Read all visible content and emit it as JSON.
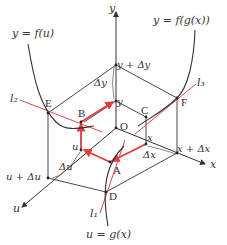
{
  "colors": {
    "axis": "#333333",
    "curve": "#333333",
    "tangent": "#e0474c",
    "path": "#e8393f",
    "background": "#ffffff"
  },
  "axes": {
    "y_label": "y",
    "x_label": "x",
    "u_label": "u"
  },
  "curves": {
    "f_u": "y = f(u)",
    "f_g_x": "y = f(g(x))",
    "g_x": "u = g(x)"
  },
  "tangents": {
    "l1": "l₁",
    "l2": "l₂",
    "l3": "l₃"
  },
  "points": {
    "O": "O",
    "A": "A",
    "B": "B",
    "C": "C",
    "D": "D",
    "E": "E",
    "F": "F"
  },
  "ticks": {
    "y": "y",
    "y_plus_dy": "y + Δy",
    "dy": "Δy",
    "x": "x",
    "x_plus_dx": "x + Δx",
    "dx": "Δx",
    "u": "u",
    "u_plus_du": "u + Δu",
    "du": "Δu"
  }
}
